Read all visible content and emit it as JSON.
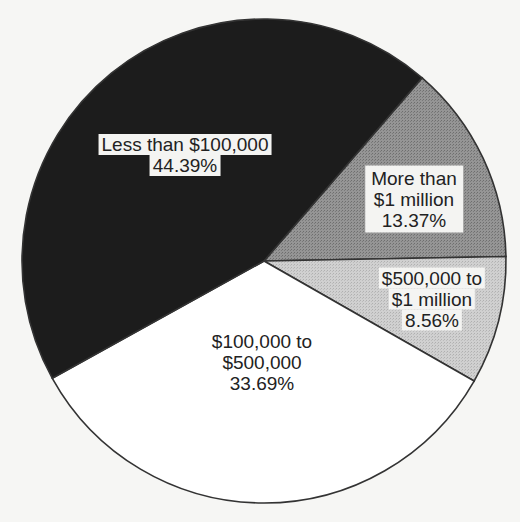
{
  "chart_data": {
    "type": "pie",
    "title": "",
    "start_angle_deg": 40.8,
    "direction": "clockwise",
    "center": [
      264,
      261
    ],
    "radius": 242,
    "slices": [
      {
        "label": "More than $1 million",
        "label_lines": [
          "More than",
          "$1 million",
          "13.37%"
        ],
        "value": 13.37,
        "color": "#8c8c8c",
        "pattern": "dotted-gray"
      },
      {
        "label": "$500,000 to $1 million",
        "label_lines": [
          "$500,000 to",
          "$1 million",
          "8.56%"
        ],
        "value": 8.56,
        "color": "#c8c8c8",
        "pattern": "dotted-light"
      },
      {
        "label": "$100,000 to $500,000",
        "label_lines": [
          "$100,000 to",
          "$500,000",
          "33.69%"
        ],
        "value": 33.69,
        "color": "#ffffff",
        "pattern": "none"
      },
      {
        "label": "Less than $100,000",
        "label_lines": [
          "Less than $100,000",
          "44.39%"
        ],
        "value": 44.39,
        "color": "#1c1c1c",
        "pattern": "none"
      }
    ],
    "categories": [
      "Less than $100,000",
      "$100,000 to $500,000",
      "$500,000 to $1 million",
      "More than $1 million"
    ],
    "values": [
      44.39,
      33.69,
      8.56,
      13.37
    ],
    "unit": "%",
    "legend": "none (labels on slices)"
  },
  "labels": {
    "less_100k": {
      "line1": "Less than $100,000",
      "line2": "44.39%"
    },
    "more_1m": {
      "line1": "More than",
      "line2": "$1 million",
      "line3": "13.37%"
    },
    "k500_1m": {
      "line1": "$500,000 to",
      "line2": "$1 million",
      "line3": "8.56%"
    },
    "k100_500k": {
      "line1": "$100,000 to",
      "line2": "$500,000",
      "line3": "33.69%"
    }
  }
}
